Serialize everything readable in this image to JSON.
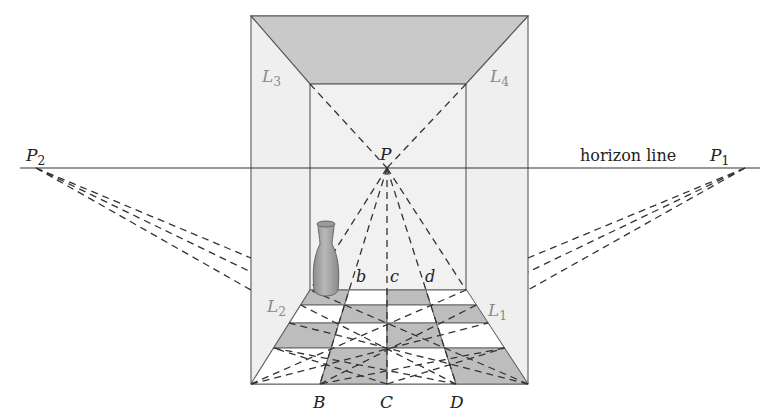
{
  "diagram": {
    "type": "one-point and two-point perspective room with tiled floor",
    "horizon": {
      "label": "horizon line",
      "y": 168,
      "x1": 20,
      "x2": 760
    },
    "vanishing_points": {
      "P": {
        "label": "P",
        "sub": "",
        "x": 387,
        "y": 168
      },
      "P1": {
        "label": "P",
        "sub": "1",
        "x": 745,
        "y": 168
      },
      "P2": {
        "label": "P",
        "sub": "2",
        "x": 36,
        "y": 168
      }
    },
    "room": {
      "outer": {
        "left": 251,
        "right": 528,
        "top": 16,
        "bottom": 384
      },
      "inner": {
        "left": 310,
        "right": 466,
        "top": 84,
        "bottom": 290
      }
    },
    "wall_labels": [
      {
        "text": "L",
        "sub": "3",
        "x": 262,
        "y": 82
      },
      {
        "text": "L",
        "sub": "4",
        "x": 490,
        "y": 82
      },
      {
        "text": "L",
        "sub": "2",
        "x": 267,
        "y": 312
      },
      {
        "text": "L",
        "sub": "1",
        "x": 488,
        "y": 316
      }
    ],
    "back_points": [
      {
        "text": "b",
        "x": 356,
        "y": 282
      },
      {
        "text": "c",
        "x": 390,
        "y": 282
      },
      {
        "text": "d",
        "x": 425,
        "y": 282
      }
    ],
    "front_points": [
      {
        "text": "B",
        "x": 313,
        "y": 408
      },
      {
        "text": "C",
        "x": 380,
        "y": 408
      },
      {
        "text": "D",
        "x": 450,
        "y": 408
      }
    ],
    "floor": {
      "rows_y": [
        290,
        305,
        323,
        348,
        384
      ],
      "back_x": [
        310,
        347,
        387,
        428,
        466
      ],
      "front_x": [
        251,
        320,
        387,
        456,
        528
      ]
    },
    "colors": {
      "wall": "#efefef",
      "ceiling": "#c9c9c9",
      "tile_dark": "#bdbdbd",
      "tile_light": "#ffffff",
      "line": "#555555",
      "label_gray": "#8a8a8a",
      "vase": "#a9a9a9"
    }
  }
}
